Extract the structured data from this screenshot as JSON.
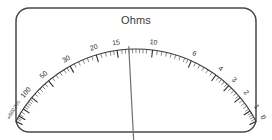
{
  "meter": {
    "title": "Ohms",
    "unit": "Ohms",
    "type": "analog-ohmmeter-dial",
    "bezel_color": "#4a4a4a",
    "face_color": "#ffffff",
    "scale_color": "#2e2e2e",
    "needle_color": "#6f6f78"
  },
  "chart_data": {
    "type": "gauge",
    "title": "Ohms",
    "xlabel": "",
    "ylabel": "Resistance (Ohms)",
    "scale_direction": "right-to-left-increasing",
    "grid": false,
    "legend": false,
    "range_min": 0,
    "range_max": 2000,
    "needle_value": 12,
    "needle_angle_deg": -3,
    "arc_start_angle_deg": -62,
    "arc_end_angle_deg": 62,
    "labeled_ticks": [
      {
        "label": "∞",
        "value": 2000,
        "angle": -62
      },
      {
        "label": "500",
        "value": 500,
        "angle": -59.5
      },
      {
        "label": "200",
        "value": 200,
        "angle": -56
      },
      {
        "label": "100",
        "value": 100,
        "angle": -50
      },
      {
        "label": "50",
        "value": 50,
        "angle": -40
      },
      {
        "label": "30",
        "value": 30,
        "angle": -29
      },
      {
        "label": "20",
        "value": 20,
        "angle": -17
      },
      {
        "label": "15",
        "value": 15,
        "angle": -8
      },
      {
        "label": "10",
        "value": 10,
        "angle": 7
      },
      {
        "label": "6",
        "value": 6,
        "angle": 24
      },
      {
        "label": "4",
        "value": 4,
        "angle": 36
      },
      {
        "label": "3",
        "value": 3,
        "angle": 43
      },
      {
        "label": "2",
        "value": 2,
        "angle": 50
      },
      {
        "label": "1",
        "value": 1,
        "angle": 57
      },
      {
        "label": "0",
        "value": 0,
        "angle": 62
      }
    ],
    "minor_tick_angles": [
      -61,
      -60.3,
      -58.8,
      -57.5,
      -55,
      -54,
      -53,
      -52,
      -51,
      -48,
      -46.5,
      -45,
      -43.5,
      -42,
      -38,
      -36,
      -34,
      -32,
      -30.5,
      -27,
      -25,
      -23,
      -21,
      -19,
      -15,
      -13,
      -11,
      -9.5,
      -6,
      -4.5,
      -3,
      -1.5,
      0,
      1.5,
      3,
      4.5,
      9,
      11,
      13,
      15,
      17,
      19,
      21,
      22.5,
      26,
      28,
      30,
      32,
      34,
      37.5,
      39,
      40.5,
      42,
      44.5,
      46,
      47.5,
      49,
      51.5,
      53,
      54.5,
      56,
      58,
      59,
      60,
      61
    ]
  }
}
